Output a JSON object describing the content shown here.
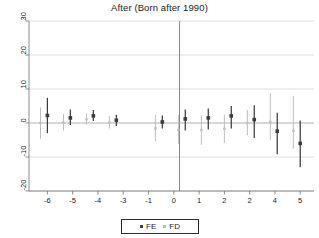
{
  "chart_data": {
    "type": "scatter",
    "title": "After (Born after 1990)",
    "subtitle": "",
    "xlabel": "",
    "ylabel": "",
    "grid": true,
    "grid_axis": "y",
    "legend_position": "bottom",
    "xlim": [
      -6.8,
      5.6
    ],
    "ylim": [
      -20,
      30
    ],
    "yticks": [
      30,
      20,
      10,
      0,
      -10,
      -20
    ],
    "ytick_labels": [
      "30",
      "20",
      "10",
      "0",
      "-10",
      "-20"
    ],
    "xticks": [
      -6,
      -5,
      -4,
      -3,
      -1,
      0,
      1,
      2,
      2,
      4,
      5
    ],
    "xtick_labels": [
      "-6",
      "-5",
      "-4",
      "-3",
      "-1",
      "0",
      "1",
      "2",
      "2",
      "4",
      "5"
    ],
    "reference_line_x": 0,
    "series": [
      {
        "name": "FE",
        "marker": "square",
        "color": "#3c3c3c",
        "points": [
          {
            "x": -6.0,
            "y": 2.2,
            "lo": -3.0,
            "hi": 7.4
          },
          {
            "x": -5.0,
            "y": 1.5,
            "lo": -0.6,
            "hi": 4.0
          },
          {
            "x": -4.0,
            "y": 2.1,
            "lo": 0.6,
            "hi": 3.8
          },
          {
            "x": -3.0,
            "y": 0.8,
            "lo": -0.9,
            "hi": 2.4
          },
          {
            "x": -1.0,
            "y": 0.3,
            "lo": -1.6,
            "hi": 2.2
          },
          {
            "x": 0.0,
            "y": 1.2,
            "lo": -2.2,
            "hi": 4.0
          },
          {
            "x": 1.0,
            "y": 1.5,
            "lo": -1.9,
            "hi": 4.3
          },
          {
            "x": 2.0,
            "y": 2.1,
            "lo": -1.6,
            "hi": 5.0
          },
          {
            "x": 3.0,
            "y": 1.0,
            "lo": -4.4,
            "hi": 5.2
          },
          {
            "x": 4.0,
            "y": -2.4,
            "lo": -9.2,
            "hi": 3.0
          },
          {
            "x": 5.0,
            "y": -6.0,
            "lo": -13.0,
            "hi": 0.7
          }
        ]
      },
      {
        "name": "FD",
        "marker": "square",
        "color": "#bdbdbd",
        "points": [
          {
            "x": -6.3,
            "y": 0.0,
            "lo": -4.6,
            "hi": 4.6
          },
          {
            "x": -5.3,
            "y": 0.1,
            "lo": -2.2,
            "hi": 2.6
          },
          {
            "x": -4.3,
            "y": 1.1,
            "lo": -0.5,
            "hi": 2.8
          },
          {
            "x": -3.3,
            "y": 0.2,
            "lo": -1.6,
            "hi": 2.0
          },
          {
            "x": -1.3,
            "y": -1.6,
            "lo": -5.4,
            "hi": 2.4
          },
          {
            "x": -0.3,
            "y": -2.0,
            "lo": -6.2,
            "hi": 2.4
          },
          {
            "x": 0.7,
            "y": -2.1,
            "lo": -6.4,
            "hi": 2.3
          },
          {
            "x": 1.7,
            "y": -1.7,
            "lo": -5.9,
            "hi": 2.5
          },
          {
            "x": 2.7,
            "y": 0.0,
            "lo": -3.6,
            "hi": 3.8
          },
          {
            "x": 3.7,
            "y": 0.3,
            "lo": -5.0,
            "hi": 8.8
          },
          {
            "x": 4.7,
            "y": -2.3,
            "lo": -7.6,
            "hi": 8.0
          }
        ]
      }
    ],
    "legend": [
      {
        "label": "FE",
        "color": "#3c3c3c"
      },
      {
        "label": "FD",
        "color": "#bdbdbd"
      }
    ]
  },
  "colors": {
    "fe": "#3c3c3c",
    "fd": "#bdbdbd",
    "grid": "#cfcfcf",
    "axis": "#6e6e6e",
    "text": "#1a1a1a",
    "background": "#ffffff"
  }
}
